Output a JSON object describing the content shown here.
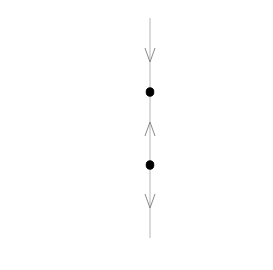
{
  "diagram": {
    "type": "phase-line",
    "orientation": "vertical",
    "colors": {
      "background": "#ffffff",
      "line": "#b5b5b5",
      "arrow": "#8a8a8a",
      "point": "#000000"
    },
    "axis": {
      "x": 150,
      "y_start": 18,
      "y_end": 238
    },
    "arrows": [
      {
        "id": "arrow-1",
        "direction": "down",
        "tip_y": 62
      },
      {
        "id": "arrow-2",
        "direction": "up",
        "tip_y": 122
      },
      {
        "id": "arrow-3",
        "direction": "down",
        "tip_y": 208
      }
    ],
    "equilibria": [
      {
        "id": "equilibrium-1",
        "y": 92,
        "filled": true
      },
      {
        "id": "equilibrium-2",
        "y": 165,
        "filled": true
      }
    ]
  }
}
